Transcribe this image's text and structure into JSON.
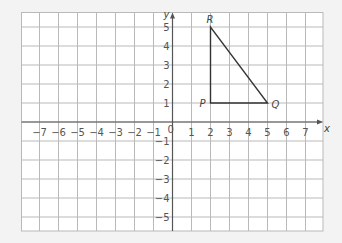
{
  "chart_data": {
    "type": "scatter",
    "title": "",
    "xlabel": "x",
    "ylabel": "y",
    "xlim": [
      -8,
      8
    ],
    "ylim": [
      -6,
      6
    ],
    "grid": true,
    "x_ticks": [
      "-7",
      "-6",
      "-5",
      "-4",
      "-3",
      "-2",
      "-1",
      "1",
      "2",
      "3",
      "4",
      "5",
      "6",
      "7"
    ],
    "y_ticks": [
      "5",
      "4",
      "3",
      "2",
      "1",
      "-1",
      "-2",
      "-3",
      "-4",
      "-5"
    ],
    "origin_label": "0",
    "shape": {
      "name": "triangle PQR",
      "vertices": [
        {
          "label": "P",
          "x": 2,
          "y": 1
        },
        {
          "label": "Q",
          "x": 5,
          "y": 1
        },
        {
          "label": "R",
          "x": 2,
          "y": 5
        }
      ]
    }
  },
  "colors": {
    "background": "#f3f3f3",
    "grid_fill": "#ffffff",
    "grid_line": "#b9b9b9",
    "axis": "#555555",
    "shape": "#333333"
  }
}
